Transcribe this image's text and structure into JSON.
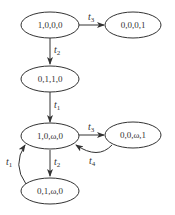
{
  "diagram": {
    "type": "reachability-graph",
    "nodes": [
      {
        "id": "A",
        "label": "1,0,0,0"
      },
      {
        "id": "B",
        "label": "0,0,0,1"
      },
      {
        "id": "C",
        "label": "0,1,1,0"
      },
      {
        "id": "D",
        "label": "1,0,ω,0"
      },
      {
        "id": "E",
        "label": "0,0,ω,1"
      },
      {
        "id": "F",
        "label": "0,1,ω,0"
      }
    ],
    "edges": [
      {
        "from": "A",
        "to": "B",
        "label": "t",
        "sub": "3"
      },
      {
        "from": "A",
        "to": "C",
        "label": "t",
        "sub": "2"
      },
      {
        "from": "C",
        "to": "D",
        "label": "t",
        "sub": "1"
      },
      {
        "from": "D",
        "to": "E",
        "label": "t",
        "sub": "3"
      },
      {
        "from": "E",
        "to": "D",
        "label": "t",
        "sub": "4"
      },
      {
        "from": "D",
        "to": "F",
        "label": "t",
        "sub": "2"
      },
      {
        "from": "F",
        "to": "D",
        "label": "t",
        "sub": "1"
      }
    ]
  }
}
